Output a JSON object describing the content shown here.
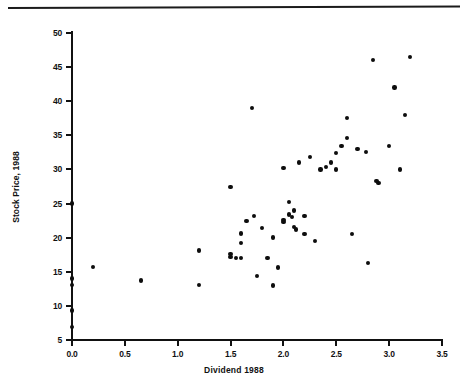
{
  "figure": {
    "top_rule": "horizontal-rule"
  },
  "chart_data": {
    "type": "scatter",
    "title": "",
    "xlabel": "Dividend  1988",
    "ylabel": "Stock Price, 1988",
    "xlim": [
      0.0,
      3.5
    ],
    "ylim": [
      5,
      50
    ],
    "xticks": [
      "0.0",
      "0.5",
      "1.0",
      "1.5",
      "2.0",
      "2.5",
      "3.0",
      "3.5"
    ],
    "xtick_values": [
      0.0,
      0.5,
      1.0,
      1.5,
      2.0,
      2.5,
      3.0,
      3.5
    ],
    "yticks": [
      "5",
      "10",
      "15",
      "20",
      "25",
      "30",
      "35",
      "40",
      "45",
      "50"
    ],
    "ytick_values": [
      5,
      10,
      15,
      20,
      25,
      30,
      35,
      40,
      45,
      50
    ],
    "grid": false,
    "legend": null,
    "marker": "filled-circle",
    "marker_color": "#0d0d0d",
    "points": [
      [
        0.0,
        25.0
      ],
      [
        0.0,
        14.0
      ],
      [
        0.0,
        13.1
      ],
      [
        0.0,
        9.3
      ],
      [
        0.0,
        6.9
      ],
      [
        0.2,
        15.7
      ],
      [
        0.65,
        13.7
      ],
      [
        1.2,
        13.1
      ],
      [
        1.2,
        18.1
      ],
      [
        1.5,
        27.4
      ],
      [
        1.5,
        17.6
      ],
      [
        1.5,
        17.2
      ],
      [
        1.55,
        17.0
      ],
      [
        1.6,
        17.0
      ],
      [
        1.6,
        19.2
      ],
      [
        1.6,
        20.6
      ],
      [
        1.65,
        22.4
      ],
      [
        1.7,
        39.0
      ],
      [
        1.72,
        23.2
      ],
      [
        1.75,
        14.4
      ],
      [
        1.8,
        21.4
      ],
      [
        1.85,
        17.0
      ],
      [
        1.9,
        13.0
      ],
      [
        1.9,
        20.0
      ],
      [
        1.95,
        15.6
      ],
      [
        2.0,
        30.2
      ],
      [
        2.0,
        22.6
      ],
      [
        2.0,
        22.3
      ],
      [
        2.05,
        25.2
      ],
      [
        2.05,
        23.4
      ],
      [
        2.08,
        23.0
      ],
      [
        2.1,
        24.0
      ],
      [
        2.1,
        21.6
      ],
      [
        2.12,
        21.2
      ],
      [
        2.15,
        31.0
      ],
      [
        2.2,
        23.2
      ],
      [
        2.2,
        20.5
      ],
      [
        2.25,
        31.8
      ],
      [
        2.3,
        19.5
      ],
      [
        2.35,
        30.0
      ],
      [
        2.4,
        30.4
      ],
      [
        2.45,
        31.0
      ],
      [
        2.5,
        32.4
      ],
      [
        2.5,
        30.0
      ],
      [
        2.55,
        33.4
      ],
      [
        2.6,
        37.5
      ],
      [
        2.6,
        34.6
      ],
      [
        2.65,
        20.5
      ],
      [
        2.7,
        33.0
      ],
      [
        2.78,
        32.6
      ],
      [
        2.8,
        16.3
      ],
      [
        2.85,
        46.0
      ],
      [
        2.88,
        28.3
      ],
      [
        2.9,
        28.0
      ],
      [
        3.0,
        33.4
      ],
      [
        3.05,
        42.0
      ],
      [
        3.1,
        30.0
      ],
      [
        3.15,
        38.0
      ],
      [
        3.2,
        46.5
      ]
    ]
  }
}
